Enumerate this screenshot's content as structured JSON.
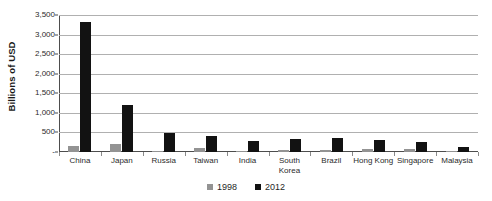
{
  "chart_data": {
    "type": "bar",
    "title": "",
    "xlabel": "",
    "ylabel": "Billions of USD",
    "ylim": [
      0,
      3500
    ],
    "ytick_labels": [
      "3,500",
      "3,000",
      "2,500",
      "2,000",
      "1,500",
      "1,000",
      "500",
      "-"
    ],
    "ytick_values": [
      3500,
      3000,
      2500,
      2000,
      1500,
      1000,
      500,
      0
    ],
    "grid": true,
    "legend_position": "bottom",
    "categories": [
      "China",
      "Japan",
      "Russia",
      "Taiwan",
      "India",
      "South Korea",
      "Brazil",
      "Hong Kong",
      "Singapore",
      "Malaysia"
    ],
    "series": [
      {
        "name": "1998",
        "color": "#939393",
        "values": [
          145,
          205,
          15,
          90,
          30,
          52,
          45,
          80,
          75,
          26
        ]
      },
      {
        "name": "2012",
        "color": "#121212",
        "values": [
          3330,
          1210,
          490,
          400,
          290,
          320,
          370,
          300,
          260,
          140
        ]
      }
    ]
  },
  "legend": {
    "items": [
      {
        "label": "1998",
        "color": "#939393"
      },
      {
        "label": "2012",
        "color": "#121212"
      }
    ]
  },
  "axis": {
    "y_title": "Billions of USD"
  }
}
